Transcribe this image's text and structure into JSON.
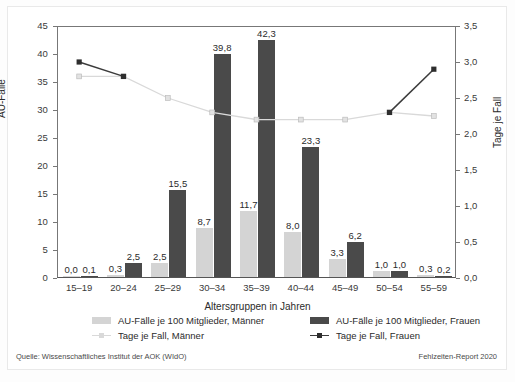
{
  "chart_data": {
    "type": "bar",
    "title": "",
    "xlabel": "Altersgruppen in Jahren",
    "ylabel": "AU-Fälle",
    "ylabel_secondary": "Tage je Fall",
    "grid": false,
    "legend_position": "bottom",
    "categories": [
      "15–19",
      "20–24",
      "25–29",
      "30–34",
      "35–39",
      "40–44",
      "45–49",
      "50–54",
      "55–59"
    ],
    "ylim": [
      0,
      45
    ],
    "yticks": [
      "0",
      "5",
      "10",
      "15",
      "20",
      "25",
      "30",
      "35",
      "40",
      "45"
    ],
    "ylim_secondary": [
      0.0,
      3.5
    ],
    "yticks_secondary": [
      "0,0",
      "0,5",
      "1,0",
      "1,5",
      "2,0",
      "2,5",
      "3,0",
      "3,5"
    ],
    "series": [
      {
        "name": "AU-Fälle je 100 Mitglieder, Männer",
        "type": "bar",
        "axis": "left",
        "color": "#d4d4d4",
        "values": [
          0.0,
          0.3,
          2.5,
          8.7,
          11.7,
          8.0,
          3.3,
          1.0,
          0.3
        ],
        "labels": [
          "0,0",
          "0,3",
          "2,5",
          "8,7",
          "11,7",
          "8,0",
          "3,3",
          "1,0",
          "0,3"
        ]
      },
      {
        "name": "AU-Fälle je 100 Mitglieder, Frauen",
        "type": "bar",
        "axis": "left",
        "color": "#4a4a4a",
        "values": [
          0.1,
          2.5,
          15.5,
          39.8,
          42.3,
          23.3,
          6.2,
          1.0,
          0.2
        ],
        "labels": [
          "0,1",
          "2,5",
          "15,5",
          "39,8",
          "42,3",
          "23,3",
          "6,2",
          "1,0",
          "0,2"
        ]
      },
      {
        "name": "Tage je Fall, Männer",
        "type": "line",
        "axis": "right",
        "color": "#d9d9d9",
        "values": [
          2.8,
          2.8,
          2.5,
          2.3,
          2.2,
          2.2,
          2.2,
          2.3,
          2.25
        ]
      },
      {
        "name": "Tage je Fall, Frauen",
        "type": "line",
        "axis": "right",
        "color": "#3b3b3b",
        "values": [
          3.0,
          2.8,
          null,
          null,
          null,
          null,
          null,
          2.3,
          2.9
        ]
      }
    ]
  },
  "axes": {
    "left_label": "AU-Fälle",
    "right_label": "Tage je Fall",
    "x_label": "Altersgruppen in Jahren",
    "left_ticks": [
      "45",
      "40",
      "35",
      "30",
      "25",
      "20",
      "15",
      "10",
      "5",
      "0"
    ],
    "right_ticks": [
      "3,5",
      "3,0",
      "2,5",
      "2,0",
      "1,5",
      "1,0",
      "0,5",
      "0,0"
    ],
    "x_ticks": [
      "15–19",
      "20–24",
      "25–29",
      "30–34",
      "35–39",
      "40–44",
      "45–49",
      "50–54",
      "55–59"
    ]
  },
  "legend": {
    "items": [
      {
        "label": "AU-Fälle je 100 Mitglieder, Männer",
        "marker": "swatch-men",
        "color": "#d4d4d4"
      },
      {
        "label": "AU-Fälle je 100 Mitglieder, Frauen",
        "marker": "swatch-women",
        "color": "#4a4a4a"
      },
      {
        "label": "Tage je Fall, Männer",
        "marker": "line-men",
        "color": "#d9d9d9"
      },
      {
        "label": "Tage je Fall, Frauen",
        "marker": "line-women",
        "color": "#3b3b3b"
      }
    ]
  },
  "footer": {
    "source": "Quelle: Wissenschaftliches Institut der AOK (WIdO)",
    "report": "Fehlzeiten-Report 2020"
  },
  "bar_labels": {
    "men": [
      "0,0",
      "0,3",
      "2,5",
      "8,7",
      "11,7",
      "8,0",
      "3,3",
      "1,0",
      "0,3"
    ],
    "women": [
      "0,1",
      "2,5",
      "15,5",
      "39,8",
      "42,3",
      "23,3",
      "6,2",
      "1,0",
      "0,2"
    ]
  }
}
